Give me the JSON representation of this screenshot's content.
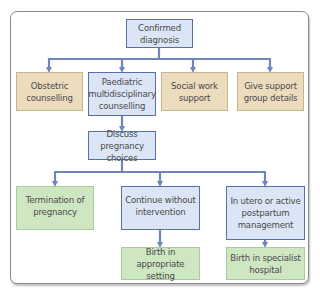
{
  "diagram": {
    "colors": {
      "connector": "#6f86bd",
      "blue_fill": "#dbe5f5",
      "blue_border": "#5671a8",
      "tan_fill": "#ecdcbe",
      "green_fill": "#cfe6c3",
      "text": "#4a4a4a"
    },
    "root": {
      "label": "Confirmed diagnosis"
    },
    "level1": [
      {
        "label": "Obstetric counselling",
        "style": "tan"
      },
      {
        "label": "Paediatric multidisciplinary counselling",
        "style": "blue"
      },
      {
        "label": "Social work support",
        "style": "tan"
      },
      {
        "label": "Give support group details",
        "style": "tan"
      }
    ],
    "level2": {
      "label": "Discuss pregnancy choices"
    },
    "level3": [
      {
        "label": "Termination of pregnancy",
        "style": "green"
      },
      {
        "label": "Continue without intervention",
        "style": "blue"
      },
      {
        "label": "In utero or active postpartum management",
        "style": "blue"
      }
    ],
    "level4": [
      {
        "label": "Birth in appropriate setting",
        "style": "green"
      },
      {
        "label": "Birth in specialist hospital",
        "style": "green"
      }
    ]
  }
}
